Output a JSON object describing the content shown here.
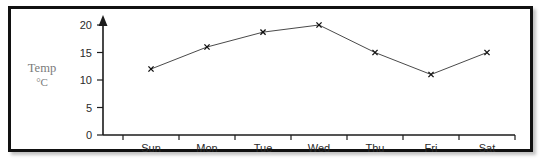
{
  "chart_data": {
    "type": "line",
    "title": "",
    "subtitle": "",
    "xlabel": "",
    "ylabel": "Temp",
    "ylabel_unit": "°C",
    "categories": [
      "Sun",
      "Mon",
      "Tue",
      "Wed",
      "Thu",
      "Fri",
      "Sat"
    ],
    "values": [
      12,
      16,
      18.7,
      20,
      15,
      11,
      15
    ],
    "series": [
      {
        "name": "Temp °C",
        "values": [
          12,
          16,
          18.7,
          20,
          15,
          11,
          15
        ]
      }
    ],
    "y_ticks": [
      0,
      5,
      10,
      15,
      20
    ],
    "y_tick_labels": [
      "0",
      "5",
      "10",
      "15",
      "20"
    ],
    "ylim": [
      0,
      20
    ],
    "grid": false,
    "legend": false,
    "legend_position": "none",
    "marker": "x",
    "y_axis_arrow": true,
    "colors": {
      "line": "#4a4a4a",
      "marker": "#111111",
      "axis": "#1b1b1b",
      "tick_label": "#2a2a2a",
      "axis_label": "#7b7b7b",
      "frame": "#111111",
      "background": "#ffffff"
    }
  },
  "axis": {
    "y_label_line1": "Temp",
    "y_label_line2": "°C",
    "y_tick_0": "0",
    "y_tick_1": "5",
    "y_tick_2": "10",
    "y_tick_3": "15",
    "y_tick_4": "20",
    "x_tick_0": "Sun",
    "x_tick_1": "Mon",
    "x_tick_2": "Tue",
    "x_tick_3": "Wed",
    "x_tick_4": "Thu",
    "x_tick_5": "Fri",
    "x_tick_6": "Sat"
  }
}
